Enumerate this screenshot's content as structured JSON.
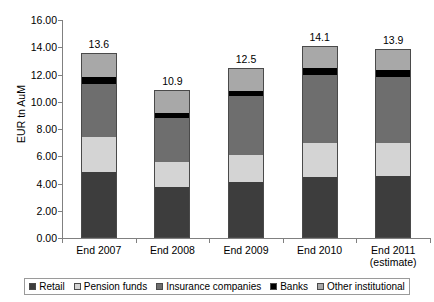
{
  "chart_data": {
    "type": "bar",
    "stacked": true,
    "title": "",
    "subtitle": "",
    "xlabel": "",
    "ylabel": "EUR tn AuM",
    "ylim": [
      0.0,
      16.0
    ],
    "ytick_labels": [
      "0.00",
      "2.00",
      "4.00",
      "6.00",
      "8.00",
      "10.00",
      "12.00",
      "14.00",
      "16.00"
    ],
    "ytick_values": [
      0,
      2,
      4,
      6,
      8,
      10,
      12,
      14,
      16
    ],
    "grid": false,
    "legend_position": "bottom",
    "categories": [
      "End 2007",
      "End 2008",
      "End 2009",
      "End 2010",
      "End 2011"
    ],
    "category_sublabels": [
      "",
      "",
      "",
      "",
      "(estimate)"
    ],
    "series": [
      {
        "name": "Retail",
        "color": "#3d3d3d",
        "values": [
          4.85,
          3.75,
          4.1,
          4.5,
          4.55
        ]
      },
      {
        "name": "Pension funds",
        "color": "#d4d4d4",
        "values": [
          2.55,
          1.85,
          2.0,
          2.5,
          2.45
        ]
      },
      {
        "name": "Insurance companies",
        "color": "#6e6e6e",
        "values": [
          3.9,
          3.2,
          4.3,
          5.0,
          4.85
        ]
      },
      {
        "name": "Banks",
        "color": "#000000",
        "values": [
          0.5,
          0.4,
          0.4,
          0.45,
          0.45
        ]
      },
      {
        "name": "Other institutional",
        "color": "#a8a8a8",
        "values": [
          1.8,
          1.7,
          1.7,
          1.65,
          1.6
        ]
      }
    ],
    "totals": [
      13.6,
      10.9,
      12.5,
      14.1,
      13.9
    ],
    "total_labels": [
      "13.6",
      "10.9",
      "12.5",
      "14.1",
      "13.9"
    ]
  },
  "legend": {
    "items": [
      {
        "label": "Retail"
      },
      {
        "label": "Pension funds"
      },
      {
        "label": "Insurance companies"
      },
      {
        "label": "Banks"
      },
      {
        "label": "Other institutional"
      }
    ]
  }
}
